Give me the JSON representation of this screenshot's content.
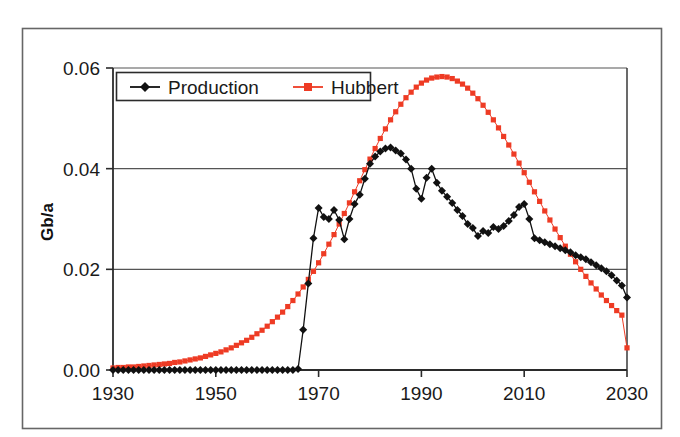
{
  "figure": {
    "background_color": "#ffffff",
    "outer_frame_color": "#555555",
    "plot_border_color": "#2b2b2b",
    "gridline_color": "#555555"
  },
  "chart_data": {
    "type": "line",
    "title": "",
    "xlabel": "",
    "ylabel": "Gb/a",
    "xlim": [
      1930,
      2030
    ],
    "ylim": [
      0.0,
      0.06
    ],
    "xticks": [
      1930,
      1950,
      1970,
      1990,
      2010,
      2030
    ],
    "xtick_labels": [
      "1930",
      "1950",
      "1970",
      "1990",
      "2010",
      "2030"
    ],
    "yticks": [
      0.0,
      0.02,
      0.04,
      0.06
    ],
    "ytick_labels": [
      "0.00",
      "0.02",
      "0.04",
      "0.06"
    ],
    "grid": "horizontal",
    "legend_position": "top-left-inside",
    "series": [
      {
        "name": "Production",
        "color": "#111111",
        "marker": "diamond",
        "marker_size": 4.0,
        "line_width": 1.3,
        "x": [
          1930,
          1931,
          1932,
          1933,
          1934,
          1935,
          1936,
          1937,
          1938,
          1939,
          1940,
          1941,
          1942,
          1943,
          1944,
          1945,
          1946,
          1947,
          1948,
          1949,
          1950,
          1951,
          1952,
          1953,
          1954,
          1955,
          1956,
          1957,
          1958,
          1959,
          1960,
          1961,
          1962,
          1963,
          1964,
          1965,
          1966,
          1967,
          1968,
          1969,
          1970,
          1971,
          1972,
          1973,
          1974,
          1975,
          1976,
          1977,
          1978,
          1979,
          1980,
          1981,
          1982,
          1983,
          1984,
          1985,
          1986,
          1987,
          1988,
          1989,
          1990,
          1991,
          1992,
          1993,
          1994,
          1995,
          1996,
          1997,
          1998,
          1999,
          2000,
          2001,
          2002,
          2003,
          2004,
          2005,
          2006,
          2007,
          2008,
          2009,
          2010,
          2011,
          2012,
          2013,
          2014,
          2015,
          2016,
          2017,
          2018,
          2019,
          2020,
          2021,
          2022,
          2023,
          2024,
          2025,
          2026,
          2027,
          2028,
          2029,
          2030
        ],
        "values": [
          0.0,
          0.0,
          0.0,
          0.0,
          0.0,
          0.0,
          0.0,
          0.0,
          0.0,
          0.0,
          0.0,
          0.0,
          0.0,
          0.0,
          0.0,
          0.0,
          0.0,
          0.0,
          0.0,
          0.0,
          0.0,
          0.0,
          0.0,
          0.0,
          0.0,
          0.0,
          0.0,
          0.0,
          0.0,
          0.0,
          0.0,
          0.0,
          0.0,
          0.0,
          0.0,
          0.0,
          0.0002,
          0.008,
          0.0172,
          0.0262,
          0.0322,
          0.0304,
          0.03,
          0.0318,
          0.0298,
          0.026,
          0.03,
          0.033,
          0.0348,
          0.038,
          0.041,
          0.0424,
          0.0434,
          0.044,
          0.0442,
          0.0436,
          0.043,
          0.0418,
          0.04,
          0.036,
          0.034,
          0.0382,
          0.04,
          0.0372,
          0.0356,
          0.0344,
          0.0332,
          0.0318,
          0.0306,
          0.029,
          0.0282,
          0.0266,
          0.0276,
          0.0272,
          0.0284,
          0.028,
          0.0286,
          0.0296,
          0.0308,
          0.0324,
          0.033,
          0.03,
          0.0262,
          0.0258,
          0.0254,
          0.025,
          0.0246,
          0.0242,
          0.0238,
          0.0234,
          0.0228,
          0.0224,
          0.022,
          0.0214,
          0.0208,
          0.0202,
          0.0196,
          0.0188,
          0.0178,
          0.0168,
          0.0144
        ]
      },
      {
        "name": "Hubbert",
        "color": "#EE3B24",
        "marker": "square",
        "marker_size": 5.2,
        "line_width": 1.0,
        "x": [
          1930,
          1931,
          1932,
          1933,
          1934,
          1935,
          1936,
          1937,
          1938,
          1939,
          1940,
          1941,
          1942,
          1943,
          1944,
          1945,
          1946,
          1947,
          1948,
          1949,
          1950,
          1951,
          1952,
          1953,
          1954,
          1955,
          1956,
          1957,
          1958,
          1959,
          1960,
          1961,
          1962,
          1963,
          1964,
          1965,
          1966,
          1967,
          1968,
          1969,
          1970,
          1971,
          1972,
          1973,
          1974,
          1975,
          1976,
          1977,
          1978,
          1979,
          1980,
          1981,
          1982,
          1983,
          1984,
          1985,
          1986,
          1987,
          1988,
          1989,
          1990,
          1991,
          1992,
          1993,
          1994,
          1995,
          1996,
          1997,
          1998,
          1999,
          2000,
          2001,
          2002,
          2003,
          2004,
          2005,
          2006,
          2007,
          2008,
          2009,
          2010,
          2011,
          2012,
          2013,
          2014,
          2015,
          2016,
          2017,
          2018,
          2019,
          2020,
          2021,
          2022,
          2023,
          2024,
          2025,
          2026,
          2027,
          2028,
          2029,
          2030
        ],
        "values": [
          0.0004,
          0.0005,
          0.0005,
          0.0006,
          0.0006,
          0.0007,
          0.0008,
          0.0009,
          0.001,
          0.0011,
          0.0012,
          0.0013,
          0.0015,
          0.0016,
          0.0018,
          0.002,
          0.0022,
          0.0024,
          0.0027,
          0.003,
          0.0033,
          0.0036,
          0.004,
          0.0044,
          0.0049,
          0.0054,
          0.0059,
          0.0065,
          0.0072,
          0.0079,
          0.0087,
          0.0096,
          0.0105,
          0.0115,
          0.0126,
          0.0138,
          0.0151,
          0.0165,
          0.018,
          0.0196,
          0.0213,
          0.0231,
          0.025,
          0.0269,
          0.029,
          0.0311,
          0.0332,
          0.0354,
          0.0376,
          0.0398,
          0.0419,
          0.044,
          0.046,
          0.0479,
          0.0497,
          0.0513,
          0.0528,
          0.0541,
          0.0552,
          0.0562,
          0.057,
          0.0576,
          0.058,
          0.0582,
          0.0583,
          0.0582,
          0.0579,
          0.0574,
          0.0568,
          0.056,
          0.055,
          0.0539,
          0.0526,
          0.0512,
          0.0497,
          0.0481,
          0.0464,
          0.0447,
          0.0429,
          0.0411,
          0.0392,
          0.0373,
          0.0354,
          0.0335,
          0.0316,
          0.0298,
          0.028,
          0.0263,
          0.0246,
          0.023,
          0.0215,
          0.02,
          0.0186,
          0.0173,
          0.0161,
          0.0149,
          0.0138,
          0.0128,
          0.0118,
          0.0109,
          0.0044
        ]
      }
    ],
    "legend": [
      {
        "label": "Production",
        "color": "#111111",
        "marker": "diamond"
      },
      {
        "label": "Hubbert",
        "color": "#EE3B24",
        "marker": "square"
      }
    ]
  }
}
